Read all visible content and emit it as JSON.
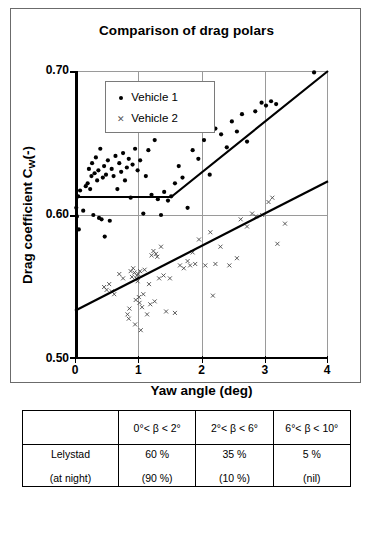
{
  "chart_data": {
    "type": "scatter",
    "title": "Comparison of drag polars",
    "xlabel": "Yaw angle (deg)",
    "ylabel_prefix": "Drag coefficient C",
    "ylabel_sub": "W",
    "ylabel_suffix": "(-)",
    "xlim": [
      0,
      4
    ],
    "ylim": [
      0.5,
      0.7
    ],
    "xticks": [
      "0",
      "1",
      "2",
      "3",
      "4"
    ],
    "yticks": [
      "0.70",
      "0.60",
      "0.50"
    ],
    "grid": "both",
    "legend_position": "top-left-inside",
    "legend": [
      {
        "name": "Vehicle 1",
        "marker": "filled-circle",
        "color": "#000000"
      },
      {
        "name": "Vehicle 2",
        "marker": "x-cross",
        "color": "#555555"
      }
    ],
    "series": [
      {
        "name": "Vehicle 1",
        "marker": "filled-circle",
        "points": [
          [
            0.02,
            0.605
          ],
          [
            0.03,
            0.599
          ],
          [
            0.05,
            0.613
          ],
          [
            0.06,
            0.59
          ],
          [
            0.08,
            0.617
          ],
          [
            0.13,
            0.603
          ],
          [
            0.17,
            0.62
          ],
          [
            0.2,
            0.622
          ],
          [
            0.22,
            0.632
          ],
          [
            0.24,
            0.618
          ],
          [
            0.26,
            0.627
          ],
          [
            0.27,
            0.636
          ],
          [
            0.29,
            0.6
          ],
          [
            0.31,
            0.629
          ],
          [
            0.33,
            0.64
          ],
          [
            0.35,
            0.624
          ],
          [
            0.37,
            0.631
          ],
          [
            0.38,
            0.598
          ],
          [
            0.4,
            0.646
          ],
          [
            0.42,
            0.597
          ],
          [
            0.44,
            0.626
          ],
          [
            0.46,
            0.634
          ],
          [
            0.47,
            0.585
          ],
          [
            0.49,
            0.628
          ],
          [
            0.52,
            0.638
          ],
          [
            0.55,
            0.596
          ],
          [
            0.58,
            0.632
          ],
          [
            0.61,
            0.627
          ],
          [
            0.64,
            0.641
          ],
          [
            0.67,
            0.618
          ],
          [
            0.7,
            0.636
          ],
          [
            0.73,
            0.63
          ],
          [
            0.76,
            0.643
          ],
          [
            0.79,
            0.624
          ],
          [
            0.82,
            0.633
          ],
          [
            0.85,
            0.639
          ],
          [
            0.88,
            0.612
          ],
          [
            0.91,
            0.635
          ],
          [
            0.95,
            0.646
          ],
          [
            0.99,
            0.631
          ],
          [
            1.03,
            0.638
          ],
          [
            1.08,
            0.601
          ],
          [
            1.12,
            0.627
          ],
          [
            1.16,
            0.645
          ],
          [
            1.21,
            0.614
          ],
          [
            1.26,
            0.652
          ],
          [
            1.31,
            0.611
          ],
          [
            1.36,
            0.6
          ],
          [
            1.41,
            0.616
          ],
          [
            1.47,
            0.61
          ],
          [
            1.52,
            0.613
          ],
          [
            1.58,
            0.622
          ],
          [
            1.64,
            0.634
          ],
          [
            1.7,
            0.626
          ],
          [
            1.78,
            0.605
          ],
          [
            1.86,
            0.645
          ],
          [
            1.95,
            0.639
          ],
          [
            2.04,
            0.652
          ],
          [
            2.13,
            0.628
          ],
          [
            2.22,
            0.66
          ],
          [
            2.31,
            0.656
          ],
          [
            2.4,
            0.647
          ],
          [
            2.48,
            0.665
          ],
          [
            2.56,
            0.658
          ],
          [
            2.64,
            0.67
          ],
          [
            2.72,
            0.651
          ],
          [
            2.85,
            0.672
          ],
          [
            2.95,
            0.678
          ],
          [
            3.02,
            0.676
          ],
          [
            3.1,
            0.679
          ],
          [
            3.18,
            0.677
          ],
          [
            3.78,
            0.699
          ]
        ],
        "trend": {
          "type": "piecewise",
          "segments": [
            [
              0.0,
              0.6125
            ],
            [
              1.52,
              0.6125
            ],
            [
              4.0,
              0.7
            ]
          ]
        }
      },
      {
        "name": "Vehicle 2",
        "marker": "x-cross",
        "points": [
          [
            0.46,
            0.55
          ],
          [
            0.5,
            0.548
          ],
          [
            0.54,
            0.552
          ],
          [
            0.58,
            0.547
          ],
          [
            0.62,
            0.545
          ],
          [
            0.7,
            0.559
          ],
          [
            0.76,
            0.556
          ],
          [
            0.83,
            0.531
          ],
          [
            0.85,
            0.528
          ],
          [
            0.86,
            0.535
          ],
          [
            0.88,
            0.561
          ],
          [
            0.9,
            0.557
          ],
          [
            0.92,
            0.563
          ],
          [
            0.94,
            0.56
          ],
          [
            0.95,
            0.524
          ],
          [
            0.96,
            0.541
          ],
          [
            0.97,
            0.556
          ],
          [
            0.98,
            0.558
          ],
          [
            0.99,
            0.554
          ],
          [
            1.0,
            0.559
          ],
          [
            1.01,
            0.543
          ],
          [
            1.02,
            0.539
          ],
          [
            1.03,
            0.561
          ],
          [
            1.04,
            0.52
          ],
          [
            1.06,
            0.536
          ],
          [
            1.08,
            0.545
          ],
          [
            1.1,
            0.562
          ],
          [
            1.14,
            0.531
          ],
          [
            1.17,
            0.552
          ],
          [
            1.19,
            0.538
          ],
          [
            1.21,
            0.572
          ],
          [
            1.24,
            0.575
          ],
          [
            1.26,
            0.54
          ],
          [
            1.28,
            0.573
          ],
          [
            1.3,
            0.571
          ],
          [
            1.33,
            0.556
          ],
          [
            1.36,
            0.578
          ],
          [
            1.4,
            0.558
          ],
          [
            1.44,
            0.533
          ],
          [
            1.5,
            0.556
          ],
          [
            1.58,
            0.532
          ],
          [
            1.66,
            0.565
          ],
          [
            1.72,
            0.563
          ],
          [
            1.78,
            0.568
          ],
          [
            1.82,
            0.565
          ],
          [
            1.86,
            0.574
          ],
          [
            1.9,
            0.566
          ],
          [
            1.96,
            0.583
          ],
          [
            2.06,
            0.565
          ],
          [
            2.14,
            0.588
          ],
          [
            2.18,
            0.544
          ],
          [
            2.22,
            0.566
          ],
          [
            2.3,
            0.578
          ],
          [
            2.44,
            0.565
          ],
          [
            2.56,
            0.57
          ],
          [
            2.62,
            0.597
          ],
          [
            2.72,
            0.592
          ],
          [
            2.8,
            0.601
          ],
          [
            2.86,
            0.599
          ],
          [
            2.96,
            0.6
          ],
          [
            3.06,
            0.609
          ],
          [
            3.12,
            0.612
          ],
          [
            3.2,
            0.58
          ],
          [
            3.32,
            0.594
          ]
        ],
        "trend": {
          "type": "linear",
          "segments": [
            [
              0.0,
              0.5335
            ],
            [
              4.0,
              0.6235
            ]
          ]
        }
      }
    ]
  },
  "table": {
    "header": [
      "",
      "0°< β < 2°",
      "2°< β < 6°",
      "6°< β < 10°"
    ],
    "rows": [
      {
        "cells": [
          {
            "main": "Lelystad",
            "sub": "(at night)"
          },
          {
            "main": "60 %",
            "sub": "(90 %)"
          },
          {
            "main": "35 %",
            "sub": "(10 %)"
          },
          {
            "main": "5 %",
            "sub": "(nil)"
          }
        ]
      }
    ]
  }
}
